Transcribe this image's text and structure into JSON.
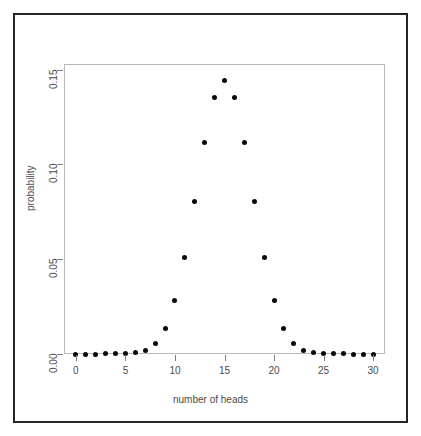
{
  "chart_data": {
    "type": "scatter",
    "title": "",
    "xlabel": "number of heads",
    "ylabel": "probability",
    "xlim": [
      -1.2,
      31.2
    ],
    "ylim": [
      0.0,
      0.153
    ],
    "grid": false,
    "legend": null,
    "marker": {
      "shape": "filled-circle",
      "color": "#0a0a0a",
      "size_px": 5
    },
    "xticks": [
      0,
      5,
      10,
      15,
      20,
      25,
      30
    ],
    "xticklabels": [
      "0",
      "5",
      "10",
      "15",
      "20",
      "25",
      "30"
    ],
    "yticks": [
      0.0,
      0.05,
      0.1,
      0.15
    ],
    "yticklabels": [
      "0.00",
      "0.05",
      "0.10",
      "0.15"
    ],
    "x": [
      0,
      1,
      2,
      3,
      4,
      5,
      6,
      7,
      8,
      9,
      10,
      11,
      12,
      13,
      14,
      15,
      16,
      17,
      18,
      19,
      20,
      21,
      22,
      23,
      24,
      25,
      26,
      27,
      28,
      29,
      30
    ],
    "values": [
      9e-10,
      2.79e-08,
      4.051e-07,
      3.7811e-06,
      2.55226e-05,
      0.0001327177,
      0.0005529905,
      0.0018957961,
      0.0054504139,
      0.0133232784,
      0.0279788847,
      0.0508707031,
      0.0805452966,
      0.1114473646,
      0.1354503785,
      0.1444804037,
      0.1354503785,
      0.1114473646,
      0.0805452966,
      0.0508707031,
      0.0279788847,
      0.0133232784,
      0.0054504139,
      0.0018957961,
      0.0005529905,
      0.0001327177,
      2.55226e-05,
      3.7811e-06,
      4.051e-07,
      2.79e-08,
      9e-10
    ],
    "distribution": "binomial",
    "n": 30,
    "p": 0.5
  },
  "figure": {
    "background_color": "#ffffff",
    "frame_color": "#262626",
    "panel_border_color": "#b9b9b9",
    "axis_color": "#7d7d7d",
    "text_color": "#4a4a4a"
  }
}
